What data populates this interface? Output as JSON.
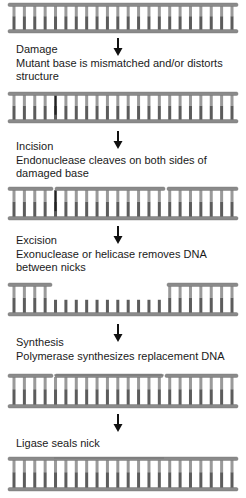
{
  "colors": {
    "strand": "#8a8a8a",
    "strand_edge": "#6f6f6f",
    "rung_light": "#9a9a9a",
    "rung_dark": "#5c5c5c",
    "damage_mark": "#222222",
    "arrow": "#111111"
  },
  "ladders": [
    {
      "id": "initial-dna",
      "top": 2,
      "height": 32,
      "rungs": 22,
      "damage": null,
      "top_nicks": [],
      "gap": null
    },
    {
      "id": "damaged-dna",
      "top": 91,
      "height": 33,
      "rungs": 22,
      "damage": 4,
      "top_nicks": [],
      "gap": null
    },
    {
      "id": "incised-dna",
      "top": 186,
      "height": 35,
      "rungs": 22,
      "damage": 4,
      "top_nicks": [
        54,
        166
      ],
      "gap": null
    },
    {
      "id": "excised-dna",
      "top": 282,
      "height": 35,
      "rungs": 22,
      "damage": null,
      "top_nicks": [],
      "gap": [
        52,
        167
      ]
    },
    {
      "id": "synthesized-dna",
      "top": 373,
      "height": 36,
      "rungs": 22,
      "damage": null,
      "top_nicks": [
        54,
        164
      ],
      "gap": null,
      "new_segment": [
        54,
        164
      ]
    },
    {
      "id": "ligated-dna",
      "top": 456,
      "height": 36,
      "rungs": 22,
      "damage": null,
      "top_nicks": [],
      "gap": null,
      "new_segment": [
        54,
        164
      ]
    }
  ],
  "steps": [
    {
      "title": "Damage",
      "lines": [
        "Mutant base is mismatched and/or distorts",
        "structure"
      ],
      "arrow_top": 38,
      "text_top": 43
    },
    {
      "title": "Incision",
      "lines": [
        "Endonuclease cleaves on both sides of",
        "damaged base"
      ],
      "arrow_top": 131,
      "text_top": 140
    },
    {
      "title": "Excision",
      "lines": [
        "Exonuclease or helicase removes DNA",
        "between nicks"
      ],
      "arrow_top": 226,
      "text_top": 234
    },
    {
      "title": "Synthesis",
      "lines": [
        "Polymerase synthesizes replacement DNA"
      ],
      "arrow_top": 324,
      "text_top": 336
    },
    {
      "title": "",
      "lines": [
        "Ligase seals nick"
      ],
      "arrow_top": 414,
      "text_top": 437
    }
  ]
}
